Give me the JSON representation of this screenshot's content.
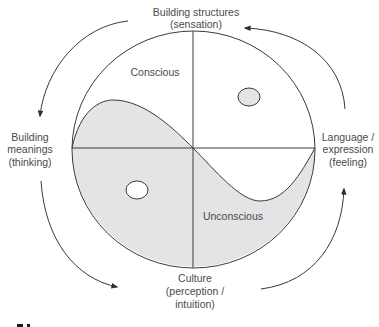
{
  "diagram": {
    "type": "yin-yang cycle diagram",
    "colors": {
      "line": "#3a3a3a",
      "shaded_region": "#e3e4e6",
      "text": "#4a4a4a",
      "background": "#ffffff"
    },
    "regions": {
      "conscious": "Conscious",
      "unconscious": "Unconscious"
    },
    "cycle_labels": {
      "top": [
        "Building structures",
        "(sensation)"
      ],
      "right": [
        "Language /",
        "expression",
        "(feeling)"
      ],
      "bottom": [
        "Culture",
        "(perception /",
        "intuition)"
      ],
      "left": [
        "Building",
        "meanings",
        "(thinking)"
      ]
    },
    "arrows": [
      {
        "from": "top",
        "to": "left",
        "direction": "counter-clockwise"
      },
      {
        "from": "left",
        "to": "bottom",
        "direction": "counter-clockwise"
      },
      {
        "from": "bottom",
        "to": "right",
        "direction": "counter-clockwise"
      },
      {
        "from": "right",
        "to": "top",
        "direction": "counter-clockwise"
      }
    ],
    "dots": [
      {
        "name": "conscious-region-dot",
        "fill": "shaded"
      },
      {
        "name": "unconscious-region-dot",
        "fill": "white"
      }
    ],
    "caption_fragment": "9.1"
  }
}
